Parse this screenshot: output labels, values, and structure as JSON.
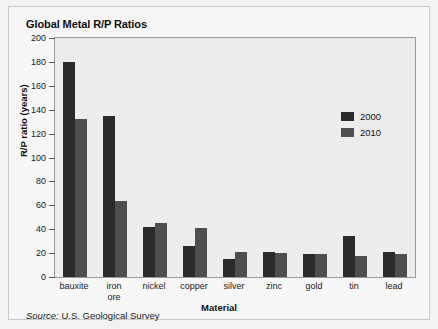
{
  "chart_data": {
    "type": "bar",
    "title": "Global Metal R/P Ratios",
    "xlabel": "Material",
    "ylabel": "R/P ratio (years)",
    "ylim": [
      0,
      200
    ],
    "ytick_step": 20,
    "yticks": [
      0,
      20,
      40,
      60,
      80,
      100,
      120,
      140,
      160,
      180,
      200
    ],
    "grid": false,
    "legend_position": "upper right inside",
    "categories": [
      "bauxite",
      "iron ore",
      "nickel",
      "copper",
      "silver",
      "zinc",
      "gold",
      "tin",
      "lead"
    ],
    "category_labels": [
      "bauxite",
      "iron\nore",
      "nickel",
      "copper",
      "silver",
      "zinc",
      "gold",
      "tin",
      "lead"
    ],
    "series": [
      {
        "name": "2000",
        "color": "#2b2b2b",
        "values": [
          180,
          135,
          42,
          26,
          15,
          21,
          19,
          34,
          21
        ]
      },
      {
        "name": "2010",
        "color": "#4f4f4f",
        "values": [
          132,
          64,
          45,
          41,
          21,
          20,
          19,
          18,
          19
        ]
      }
    ],
    "source_prefix": "Source:",
    "source_text": "U.S. Geological Survey"
  },
  "colors": {
    "series_2000": "#2b2b2b",
    "series_2010": "#4f4f4f",
    "plot_background": "#ededed",
    "card_background": "#f7f7f7",
    "axis": "#5a5a5a"
  }
}
